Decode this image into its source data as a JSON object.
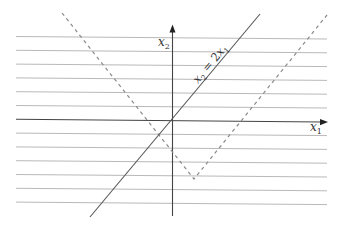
{
  "diagram": {
    "type": "coordinate-plane-lines",
    "colors": {
      "grid": "#b9b9b9",
      "axis": "#444444",
      "line": "#555555",
      "dashed": "#8a8a8a",
      "background": "#ffffff"
    },
    "axes": {
      "x_label": {
        "base": "x",
        "sub": "1"
      },
      "y_label": {
        "base": "x",
        "sub": "2"
      },
      "origin_px": [
        172,
        120
      ]
    },
    "horizontal_grid_lines_count": 13,
    "solid_line": {
      "equation": {
        "lhs_base": "x",
        "lhs_sub": "2",
        "op": " = ",
        "rhs_coef": "2",
        "rhs_base": "x",
        "rhs_sub": "1"
      },
      "description": "x2 = 2x1"
    },
    "dashed_v": {
      "description": "V-shaped dashed curve with vertex below and right of origin"
    }
  }
}
